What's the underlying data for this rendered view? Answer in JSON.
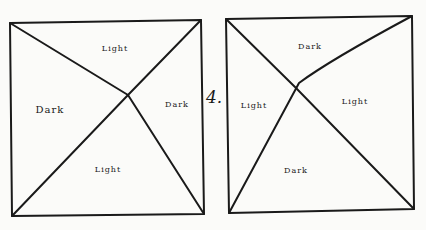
{
  "figure_number": "4.",
  "diagrams": [
    {
      "name": "left-square",
      "regions": {
        "top": "Light",
        "left": "Dark",
        "right": "Dark",
        "bottom": "Light"
      }
    },
    {
      "name": "right-square",
      "regions": {
        "top": "Dark",
        "left": "Light",
        "right": "Light",
        "bottom": "Dark"
      }
    }
  ],
  "colors": {
    "ink": "#1a1a1a",
    "paper": "#fbfbf9"
  }
}
